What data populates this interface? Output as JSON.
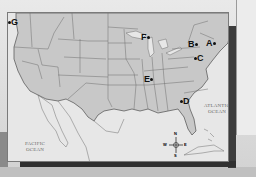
{
  "map": {
    "type": "outline map of the United States",
    "markers": [
      {
        "id": "A",
        "label": "A",
        "region": "New England / eastern New York"
      },
      {
        "id": "B",
        "label": "B",
        "region": "western New York"
      },
      {
        "id": "C",
        "label": "C",
        "region": "Pennsylvania"
      },
      {
        "id": "D",
        "label": "D",
        "region": "Georgia"
      },
      {
        "id": "E",
        "label": "E",
        "region": "Missouri"
      },
      {
        "id": "F",
        "label": "F",
        "region": "Minnesota"
      },
      {
        "id": "G",
        "label": "G",
        "region": "Washington"
      }
    ],
    "oceans": {
      "atlantic_line1": "ATLANTIC",
      "atlantic_line2": "OCEAN",
      "pacific_line1": "PACIFIC",
      "pacific_line2": "OCEAN"
    },
    "compass": {
      "n": "N",
      "s": "S",
      "e": "E",
      "w": "W"
    },
    "colors": {
      "land": "#c8c8c8",
      "water": "#e7e7e7",
      "borders": "#6e6e6e",
      "marker": "#111111"
    }
  }
}
